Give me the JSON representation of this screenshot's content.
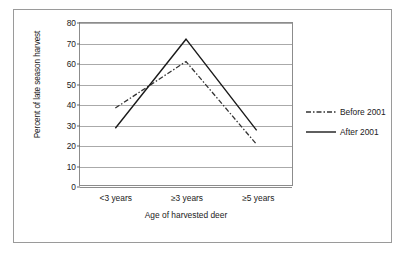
{
  "chart_data": {
    "type": "line",
    "title": "",
    "xlabel": "Age of harvested deer",
    "ylabel": "Percent of late season harvest",
    "categories": [
      "<3 years",
      "≥3 years",
      "≥5 years"
    ],
    "ylim": [
      0,
      80
    ],
    "ytick_step": 10,
    "yticks": [
      "0",
      "10",
      "20",
      "30",
      "40",
      "50",
      "60",
      "70",
      "80"
    ],
    "grid": "horizontal",
    "legend_position": "right",
    "series": [
      {
        "name": "Before 2001",
        "values": [
          38,
          61,
          20
        ],
        "style": "dash-dot",
        "color": "#333333"
      },
      {
        "name": "After 2001",
        "values": [
          28,
          72,
          27
        ],
        "style": "solid",
        "color": "#1a1a1a"
      }
    ]
  },
  "legend": {
    "items": [
      {
        "label": "Before 2001"
      },
      {
        "label": "After 2001"
      }
    ]
  }
}
